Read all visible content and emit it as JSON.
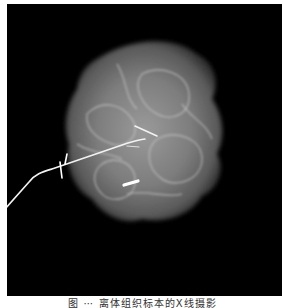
{
  "figure": {
    "background_color": "#000000",
    "specimen_color": "#bfbfbf",
    "wire_color": "#f2f2f2"
  },
  "caption": {
    "text": "图 ⋯ 离体组织标本的X线摄影"
  }
}
